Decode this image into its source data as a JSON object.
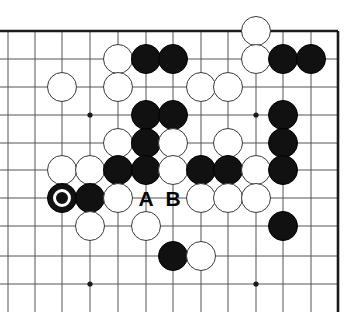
{
  "figure": {
    "kind": "go-board-diagram",
    "background_color": "#ffffff",
    "line_color": "#555555",
    "edge_color": "#1a1a1a",
    "black_color": "#111111",
    "white_fill": "#ffffff",
    "white_edge": "#3a3a3a",
    "label_color": "#000000"
  },
  "board": {
    "columns_px": [
      35,
      62,
      90,
      118,
      146,
      173,
      201,
      228,
      256,
      283,
      311,
      338
    ],
    "rows_px": [
      31,
      59,
      87,
      115,
      143,
      170,
      198,
      226,
      256,
      284
    ],
    "stone_radius_px": 15,
    "edges": {
      "top_y": 31,
      "right_x": 338,
      "left_open": true,
      "bottom_open": true
    },
    "star_points": [
      {
        "x": 90,
        "y": 115
      },
      {
        "x": 256,
        "y": 115
      },
      {
        "x": 90,
        "y": 284
      },
      {
        "x": 256,
        "y": 284
      }
    ]
  },
  "stones": [
    {
      "color": "white",
      "x": 256,
      "y": 31,
      "marked": false
    },
    {
      "color": "white",
      "x": 118,
      "y": 59,
      "marked": false
    },
    {
      "color": "black",
      "x": 146,
      "y": 59,
      "marked": false
    },
    {
      "color": "black",
      "x": 173,
      "y": 59,
      "marked": false
    },
    {
      "color": "white",
      "x": 256,
      "y": 59,
      "marked": false
    },
    {
      "color": "black",
      "x": 283,
      "y": 59,
      "marked": false
    },
    {
      "color": "black",
      "x": 311,
      "y": 59,
      "marked": false
    },
    {
      "color": "white",
      "x": 62,
      "y": 87,
      "marked": false
    },
    {
      "color": "white",
      "x": 118,
      "y": 87,
      "marked": false
    },
    {
      "color": "white",
      "x": 201,
      "y": 87,
      "marked": false
    },
    {
      "color": "white",
      "x": 228,
      "y": 87,
      "marked": false
    },
    {
      "color": "black",
      "x": 146,
      "y": 115,
      "marked": false
    },
    {
      "color": "black",
      "x": 173,
      "y": 115,
      "marked": false
    },
    {
      "color": "black",
      "x": 283,
      "y": 115,
      "marked": false
    },
    {
      "color": "white",
      "x": 118,
      "y": 143,
      "marked": false
    },
    {
      "color": "black",
      "x": 146,
      "y": 143,
      "marked": false
    },
    {
      "color": "white",
      "x": 173,
      "y": 143,
      "marked": false
    },
    {
      "color": "white",
      "x": 228,
      "y": 143,
      "marked": false
    },
    {
      "color": "black",
      "x": 283,
      "y": 143,
      "marked": false
    },
    {
      "color": "white",
      "x": 62,
      "y": 170,
      "marked": false
    },
    {
      "color": "white",
      "x": 90,
      "y": 170,
      "marked": false
    },
    {
      "color": "black",
      "x": 118,
      "y": 170,
      "marked": false
    },
    {
      "color": "black",
      "x": 146,
      "y": 170,
      "marked": false
    },
    {
      "color": "white",
      "x": 173,
      "y": 170,
      "marked": false
    },
    {
      "color": "black",
      "x": 201,
      "y": 170,
      "marked": false
    },
    {
      "color": "black",
      "x": 228,
      "y": 170,
      "marked": false
    },
    {
      "color": "white",
      "x": 256,
      "y": 170,
      "marked": false
    },
    {
      "color": "black",
      "x": 283,
      "y": 170,
      "marked": false
    },
    {
      "color": "black",
      "x": 62,
      "y": 198,
      "marked": true
    },
    {
      "color": "black",
      "x": 90,
      "y": 198,
      "marked": false
    },
    {
      "color": "white",
      "x": 118,
      "y": 198,
      "marked": false
    },
    {
      "color": "white",
      "x": 201,
      "y": 198,
      "marked": false
    },
    {
      "color": "white",
      "x": 228,
      "y": 198,
      "marked": false
    },
    {
      "color": "white",
      "x": 256,
      "y": 198,
      "marked": false
    },
    {
      "color": "white",
      "x": 90,
      "y": 226,
      "marked": false
    },
    {
      "color": "white",
      "x": 146,
      "y": 226,
      "marked": false
    },
    {
      "color": "black",
      "x": 283,
      "y": 226,
      "marked": false
    },
    {
      "color": "black",
      "x": 173,
      "y": 256,
      "marked": false
    },
    {
      "color": "white",
      "x": 201,
      "y": 256,
      "marked": false
    }
  ],
  "point_labels": [
    {
      "text": "A",
      "x": 146,
      "y": 198
    },
    {
      "text": "B",
      "x": 173,
      "y": 198
    }
  ]
}
